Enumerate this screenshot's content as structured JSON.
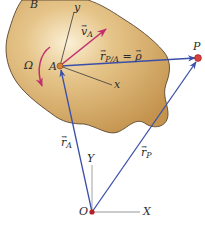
{
  "diagram": {
    "colors": {
      "body_fill_light": "#f3dcae",
      "body_fill_dark": "#c99a52",
      "body_outline": "#5a4630",
      "position_vector": "#3b4fa8",
      "velocity_vector": "#c0306e",
      "angular_velocity": "#c0306e",
      "axis_line": "#555555",
      "point_A": "#d8843a",
      "point_P": "#d94040",
      "point_O": "#b3202a"
    },
    "labels": {
      "body": "B",
      "body_x_axis": "x",
      "body_y_axis": "y",
      "point_A": "A",
      "point_P": "P",
      "origin": "O",
      "fixed_X_axis": "X",
      "fixed_Y_axis": "Y",
      "angular_velocity": "Ω",
      "velocity_A_main": "v",
      "velocity_A_sub": "A",
      "r_PA_main": "r",
      "r_PA_sub": "P/A",
      "r_PA_equals": "=",
      "rho": "ρ",
      "r_A_main": "r",
      "r_A_sub": "A",
      "r_P_main": "r",
      "r_P_sub": "P",
      "vector_arrow": "→"
    },
    "points": {
      "A": [
        60,
        66
      ],
      "P": [
        198,
        58
      ],
      "O": [
        92,
        212
      ]
    }
  }
}
